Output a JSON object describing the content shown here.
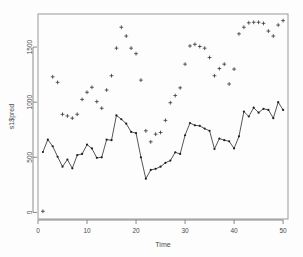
{
  "chart_data": {
    "type": "line",
    "title": "",
    "xlabel": "Time",
    "ylabel": "s1$pred",
    "xlim": [
      0,
      51
    ],
    "ylim": [
      -60,
      1800
    ],
    "grid": false,
    "legend_position": "none",
    "xticks": [
      0,
      10,
      20,
      30,
      40,
      50
    ],
    "yticks": [
      0,
      500,
      1000,
      1500
    ],
    "xtick_labels": [
      "0",
      "10",
      "20",
      "30",
      "40",
      "50"
    ],
    "ytick_labels": [
      "0",
      "500",
      "1000",
      "1500"
    ],
    "series": [
      {
        "name": "observed",
        "marker": "point",
        "line": true,
        "x": [
          1,
          2,
          3,
          4,
          5,
          6,
          7,
          8,
          9,
          10,
          11,
          12,
          13,
          14,
          15,
          16,
          17,
          18,
          19,
          20,
          21,
          22,
          23,
          24,
          25,
          26,
          27,
          28,
          29,
          30,
          31,
          32,
          33,
          34,
          35,
          36,
          37,
          38,
          39,
          40,
          41,
          42,
          43,
          44,
          45,
          46,
          47,
          48,
          49,
          50
        ],
        "values": [
          548,
          660,
          600,
          505,
          415,
          480,
          400,
          520,
          530,
          615,
          580,
          495,
          500,
          660,
          655,
          880,
          845,
          805,
          730,
          720,
          500,
          305,
          385,
          395,
          415,
          450,
          470,
          545,
          530,
          700,
          810,
          790,
          785,
          760,
          740,
          575,
          670,
          655,
          645,
          580,
          690,
          915,
          870,
          950,
          905,
          940,
          930,
          855,
          1000,
          930
        ]
      },
      {
        "name": "predicted",
        "marker": "plus",
        "line": false,
        "x": [
          1,
          3,
          4,
          5,
          6,
          7,
          8,
          9,
          10,
          11,
          12,
          13,
          14,
          15,
          16,
          17,
          18,
          19,
          20,
          21,
          22,
          23,
          24,
          25,
          26,
          27,
          28,
          29,
          30,
          31,
          32,
          33,
          34,
          35,
          36,
          37,
          38,
          39,
          40,
          41,
          42,
          43,
          44,
          45,
          46,
          47,
          48,
          49,
          50
        ],
        "values": [
          10,
          1230,
          1180,
          890,
          875,
          855,
          890,
          1025,
          1090,
          1135,
          1005,
          945,
          1110,
          1240,
          1490,
          1680,
          1600,
          1490,
          1440,
          1200,
          740,
          640,
          710,
          725,
          835,
          995,
          1060,
          1130,
          1345,
          1510,
          1525,
          1505,
          1490,
          1405,
          1240,
          1305,
          1345,
          1165,
          1300,
          1620,
          1680,
          1720,
          1725,
          1725,
          1715,
          1645,
          1600,
          1700,
          1740
        ]
      }
    ],
    "colors": {
      "line": "#2b2b2b",
      "point": "#1f1f1f",
      "plus": "#2b2b2b",
      "axis": "#9a9a9a",
      "text": "#4a4a4a",
      "background": "#fdfdfd"
    },
    "plot_box": {
      "left": 38,
      "top": 14,
      "right": 288,
      "bottom": 219
    }
  }
}
